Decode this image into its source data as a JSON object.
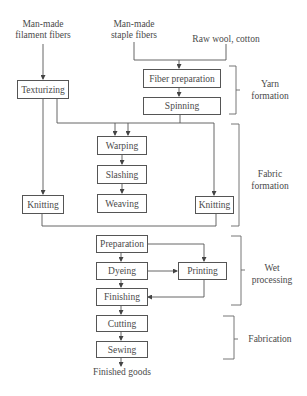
{
  "sources": {
    "filament": [
      "Man-made",
      "filament fibers"
    ],
    "staple": [
      "Man-made",
      "staple fibers"
    ],
    "raw": "Raw wool, cotton"
  },
  "processes": {
    "texturizing": "Texturizing",
    "fiber_preparation": "Fiber preparation",
    "spinning": "Spinning",
    "warping": "Warping",
    "slashing": "Slashing",
    "weaving": "Weaving",
    "knitting_left": "Knitting",
    "knitting_right": "Knitting",
    "preparation": "Preparation",
    "dyeing": "Dyeing",
    "printing": "Printing",
    "finishing": "Finishing",
    "cutting": "Cutting",
    "sewing": "Sewing"
  },
  "output": "Finished goods",
  "stages": {
    "yarn": [
      "Yarn",
      "formation"
    ],
    "fabric": [
      "Fabric",
      "formation"
    ],
    "wet": [
      "Wet",
      "processing"
    ],
    "fabrication": "Fabrication"
  },
  "colors": {
    "line": "#555555",
    "text": "#4a4a4a",
    "background": "#ffffff"
  }
}
